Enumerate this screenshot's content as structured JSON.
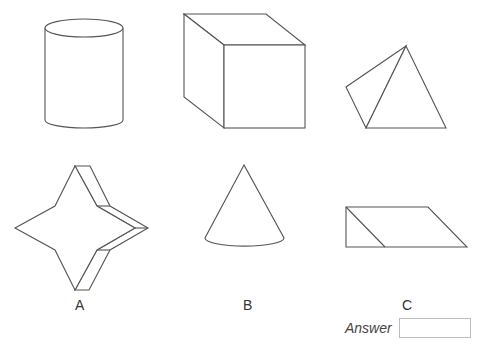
{
  "figure": {
    "shapes": [
      {
        "name": "cylinder",
        "row": 1,
        "col": 1
      },
      {
        "name": "cube",
        "row": 1,
        "col": 2
      },
      {
        "name": "tetrahedron",
        "row": 1,
        "col": 3
      },
      {
        "name": "star-prism",
        "row": 2,
        "col": 1
      },
      {
        "name": "cone",
        "row": 2,
        "col": 2
      },
      {
        "name": "parallelogram-prism",
        "row": 2,
        "col": 3
      }
    ],
    "column_labels": [
      "A",
      "B",
      "C"
    ]
  },
  "answer": {
    "label": "Answer",
    "value": ""
  }
}
